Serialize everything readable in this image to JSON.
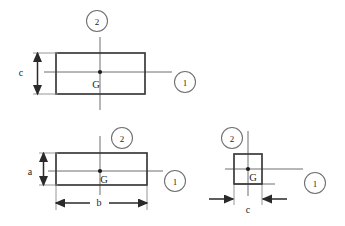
{
  "diagram": {
    "colors": {
      "outline": "#3a3a3c",
      "axis": "#6f6f70",
      "dimension": "#2a2a2c",
      "extension": "#8a8a8c",
      "text": "#1d1d1f",
      "background": "#ffffff"
    },
    "figures": [
      {
        "id": "figure-top",
        "name": "top-section",
        "centroid_label": "G",
        "axis_1_label": "1",
        "axis_2_label": "2",
        "dimensions": [
          {
            "name": "height",
            "label": "c",
            "orientation": "vertical"
          }
        ]
      },
      {
        "id": "figure-middle",
        "name": "middle-section",
        "centroid_label": "G",
        "axis_1_label": "1",
        "axis_2_label": "2",
        "dimensions": [
          {
            "name": "height",
            "label": "a",
            "orientation": "vertical"
          },
          {
            "name": "width",
            "label": "b",
            "orientation": "horizontal"
          }
        ]
      },
      {
        "id": "figure-right",
        "name": "right-section",
        "centroid_label": "G",
        "axis_1_label": "1",
        "axis_2_label": "2",
        "dimensions": [
          {
            "name": "width",
            "label": "c",
            "orientation": "horizontal"
          }
        ]
      }
    ]
  }
}
